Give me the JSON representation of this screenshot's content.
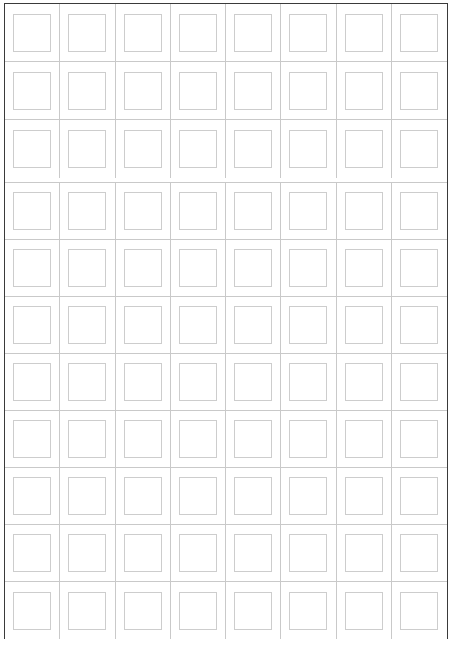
{
  "sheet": {
    "name": "blank-grid-sheet",
    "columns": 8,
    "frame_color": "#3a3a3a",
    "grid_line_color": "#c9c9c9",
    "placeholder_border_color": "#cdcdcd",
    "background_color": "#ffffff"
  },
  "sections": [
    {
      "name": "header-section",
      "rows": 3,
      "columns": 8,
      "cells": [
        [
          "",
          "",
          "",
          "",
          "",
          "",
          "",
          ""
        ],
        [
          "",
          "",
          "",
          "",
          "",
          "",
          "",
          ""
        ],
        [
          "",
          "",
          "",
          "",
          "",
          "",
          "",
          ""
        ]
      ]
    },
    {
      "name": "body-section",
      "rows": 8,
      "columns": 8,
      "cells": [
        [
          "",
          "",
          "",
          "",
          "",
          "",
          "",
          ""
        ],
        [
          "",
          "",
          "",
          "",
          "",
          "",
          "",
          ""
        ],
        [
          "",
          "",
          "",
          "",
          "",
          "",
          "",
          ""
        ],
        [
          "",
          "",
          "",
          "",
          "",
          "",
          "",
          ""
        ],
        [
          "",
          "",
          "",
          "",
          "",
          "",
          "",
          ""
        ],
        [
          "",
          "",
          "",
          "",
          "",
          "",
          "",
          ""
        ],
        [
          "",
          "",
          "",
          "",
          "",
          "",
          "",
          ""
        ],
        [
          "",
          "",
          "",
          "",
          "",
          "",
          "",
          ""
        ]
      ]
    }
  ]
}
